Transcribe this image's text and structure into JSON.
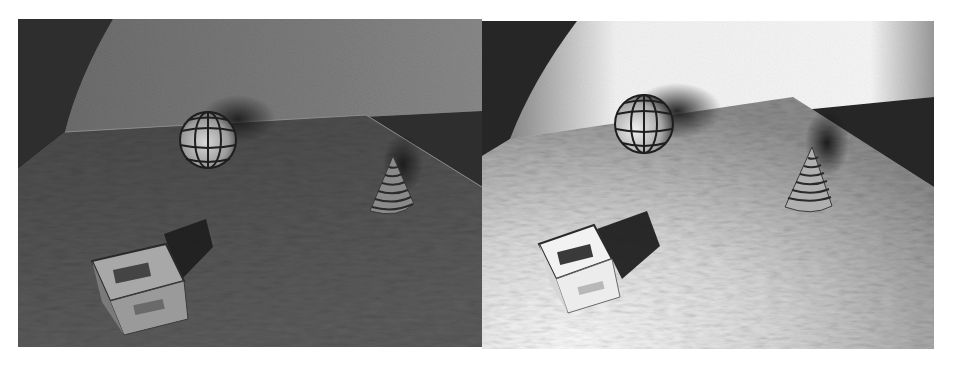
{
  "figure": {
    "panel_count": 2,
    "panels": [
      {
        "id": "left",
        "rendering": "darker, low-contrast render",
        "objects": [
          "segmented sphere",
          "ridged cone",
          "labeled cube",
          "textured floor plane",
          "curved back wall"
        ],
        "cube_label": "illegible"
      },
      {
        "id": "right",
        "rendering": "bright, high-contrast render with soft shadows",
        "objects": [
          "segmented sphere",
          "ridged cone",
          "labeled cube",
          "textured floor plane",
          "curved back wall"
        ],
        "cube_label": "illegible"
      }
    ]
  },
  "colors": {
    "page_bg": "#ffffff",
    "left_wall": "#7a7a7a",
    "left_wall_dark": "#2e2e2e",
    "left_floor": "#555555",
    "right_wall": "#f4f4f4",
    "right_wall_dark": "#262626",
    "right_floor": "#9a9a9a"
  }
}
